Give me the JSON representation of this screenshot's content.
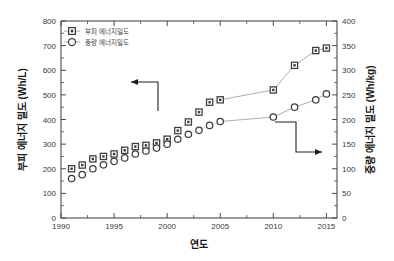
{
  "chart_data": {
    "type": "scatter",
    "title": "",
    "xlabel": "연도",
    "ylabel": "부피 에너지 밀도 (Wh/L)",
    "y2label": "중량 에너지 밀도 (Wh/kg)",
    "xlim": [
      1990,
      2016
    ],
    "ylim": [
      0,
      800
    ],
    "y2lim": [
      0,
      400
    ],
    "xticks": [
      1990,
      1995,
      2000,
      2005,
      2010,
      2015
    ],
    "xticklabels": [
      "1990",
      "1995",
      "2000",
      "2005",
      "2010",
      "2015"
    ],
    "yticks": [
      0,
      100,
      200,
      300,
      400,
      500,
      600,
      700,
      800
    ],
    "yticklabels": [
      "0",
      "100",
      "200",
      "300",
      "400",
      "500",
      "600",
      "700",
      "800"
    ],
    "y2ticks": [
      0,
      50,
      100,
      150,
      200,
      250,
      300,
      350,
      400
    ],
    "y2ticklabels": [
      "0",
      "50",
      "100",
      "150",
      "200",
      "250",
      "300",
      "350",
      "400"
    ],
    "grid": false,
    "legend_position": "upper-left",
    "series": [
      {
        "name": "부피 에너지밀도",
        "marker": "square",
        "axis": "left",
        "unit": "Wh/L",
        "x": [
          1991,
          1992,
          1993,
          1994,
          1995,
          1996,
          1997,
          1998,
          1999,
          2000,
          2001,
          2002,
          2003,
          2004,
          2005,
          2010,
          2012,
          2014,
          2015
        ],
        "values": [
          200,
          215,
          240,
          250,
          260,
          275,
          290,
          295,
          305,
          320,
          355,
          390,
          430,
          470,
          480,
          520,
          620,
          680,
          690
        ]
      },
      {
        "name": "중량 에너지밀도",
        "marker": "circle",
        "axis": "right",
        "unit": "Wh/kg",
        "x": [
          1991,
          1992,
          1993,
          1994,
          1995,
          1996,
          1997,
          1998,
          1999,
          2000,
          2001,
          2002,
          2003,
          2004,
          2005,
          2010,
          2012,
          2014,
          2015
        ],
        "values": [
          80,
          88,
          100,
          108,
          115,
          122,
          130,
          136,
          142,
          150,
          160,
          170,
          178,
          188,
          196,
          205,
          225,
          240,
          252
        ]
      }
    ],
    "annotations": [
      {
        "name": "arrow-to-left-axis",
        "direction": "left",
        "target_series": "부피 에너지밀도"
      },
      {
        "name": "arrow-to-right-axis",
        "direction": "right",
        "target_series": "중량 에너지밀도"
      }
    ]
  },
  "legend": {
    "items": [
      {
        "label": "부피 에너지밀도",
        "marker": "square"
      },
      {
        "label": "중량 에너지밀도",
        "marker": "circle"
      }
    ]
  }
}
